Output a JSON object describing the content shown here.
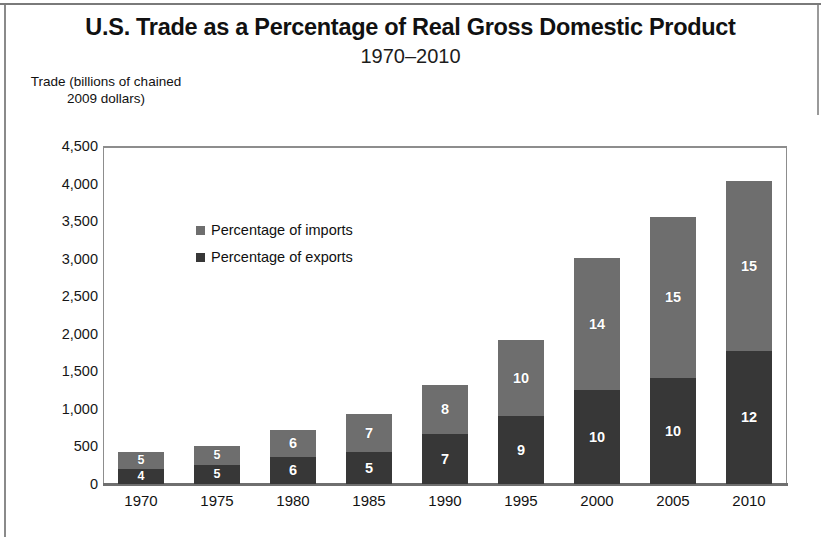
{
  "chart_data": {
    "type": "bar",
    "stacked": true,
    "title": "U.S. Trade as a Percentage of Real Gross Domestic Product",
    "subtitle": "1970–2010",
    "ylabel": "Trade (billions of chained 2009 dollars)",
    "xlabel": "",
    "ylim": [
      0,
      4500
    ],
    "ytick_labels": [
      "4,500",
      "4,000",
      "3,500",
      "3,000",
      "2,500",
      "2,000",
      "1,500",
      "1,000",
      "500",
      "0"
    ],
    "ytick_values": [
      4500,
      4000,
      3500,
      3000,
      2500,
      2000,
      1500,
      1000,
      500,
      0
    ],
    "grid": false,
    "legend_position": "inside-upper-left",
    "categories": [
      "1970",
      "1975",
      "1980",
      "1985",
      "1990",
      "1995",
      "2000",
      "2005",
      "2010"
    ],
    "series": [
      {
        "name": "Percentage of exports",
        "color": "#373737",
        "values": [
          205,
          250,
          360,
          425,
          670,
          905,
          1250,
          1410,
          1770
        ],
        "data_labels": [
          "4",
          "5",
          "6",
          "5",
          "7",
          "9",
          "10",
          "10",
          "12"
        ]
      },
      {
        "name": "Percentage of imports",
        "color": "#6e6e6e",
        "values": [
          220,
          255,
          360,
          505,
          650,
          1015,
          1760,
          2145,
          2265
        ],
        "data_labels": [
          "5",
          "5",
          "6",
          "7",
          "8",
          "10",
          "14",
          "15",
          "15"
        ]
      }
    ],
    "totals": [
      425,
      505,
      720,
      930,
      1320,
      1920,
      3010,
      3555,
      4035
    ]
  },
  "legend": {
    "items": [
      {
        "label": "Percentage of imports",
        "swatch": "#6e6e6e"
      },
      {
        "label": "Percentage of exports",
        "swatch": "#373737"
      }
    ]
  }
}
